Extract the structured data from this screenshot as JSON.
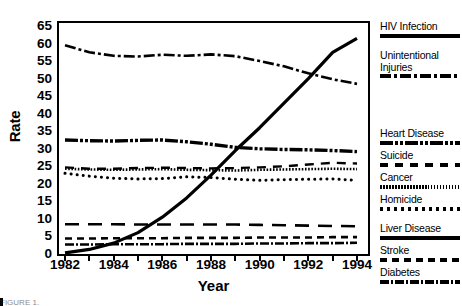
{
  "chart_data": {
    "type": "line",
    "title": "",
    "xlabel": "Year",
    "ylabel": "Rate",
    "xlim": [
      1982,
      1994
    ],
    "ylim": [
      0,
      65
    ],
    "ytick_step": 5,
    "grid": false,
    "legend_position": "right",
    "x": [
      1982,
      1983,
      1984,
      1985,
      1986,
      1987,
      1988,
      1989,
      1990,
      1991,
      1992,
      1993,
      1994
    ],
    "xtick_labels": [
      "1982",
      "1984",
      "1986",
      "1988",
      "1990",
      "1992",
      "1994"
    ],
    "ytick_labels": [
      "0",
      "5",
      "10",
      "15",
      "20",
      "25",
      "30",
      "35",
      "40",
      "45",
      "50",
      "55",
      "60",
      "65"
    ],
    "series": [
      {
        "name": "HIV Infection",
        "style": "solid",
        "values": [
          0.3,
          1.3,
          3.1,
          6.1,
          10.5,
          16.0,
          22.5,
          29.5,
          36.0,
          43.0,
          50.0,
          57.5,
          61.5
        ]
      },
      {
        "name": "Unintentional Injuries",
        "style": "dash-dot",
        "values": [
          59.5,
          57.5,
          56.5,
          56.3,
          56.8,
          56.5,
          56.9,
          56.4,
          55.0,
          53.5,
          51.5,
          49.8,
          48.5
        ]
      },
      {
        "name": "Heart Disease",
        "style": "heavy-dash-dot-dot",
        "values": [
          32.5,
          32.3,
          32.2,
          32.4,
          32.5,
          32.0,
          31.3,
          30.4,
          30.0,
          29.8,
          29.7,
          29.5,
          29.2
        ]
      },
      {
        "name": "Suicide",
        "style": "long-dash",
        "values": [
          24.7,
          24.3,
          24.3,
          24.5,
          24.6,
          24.5,
          24.4,
          24.5,
          24.7,
          25.0,
          25.5,
          26.0,
          25.8
        ]
      },
      {
        "name": "Cancer",
        "style": "fine-dotted",
        "values": [
          24.3,
          24.1,
          24.0,
          24.1,
          24.2,
          24.0,
          23.9,
          23.8,
          24.0,
          24.1,
          24.2,
          24.3,
          24.2
        ]
      },
      {
        "name": "Homicide",
        "style": "round-dotted",
        "values": [
          23.0,
          22.2,
          21.6,
          21.4,
          21.5,
          22.0,
          21.8,
          21.3,
          21.0,
          21.2,
          21.3,
          21.4,
          21.0
        ]
      },
      {
        "name": "Liver Disease",
        "style": "medium-dash",
        "values": [
          8.5,
          8.5,
          8.5,
          8.4,
          8.4,
          8.4,
          8.4,
          8.4,
          8.3,
          8.2,
          8.1,
          8.0,
          7.9
        ]
      },
      {
        "name": "Stroke",
        "style": "dashed",
        "values": [
          4.4,
          4.4,
          4.5,
          4.5,
          4.5,
          4.6,
          4.6,
          4.6,
          4.7,
          4.7,
          4.7,
          4.8,
          4.8
        ]
      },
      {
        "name": "Diabetes",
        "style": "dash-dot-short",
        "values": [
          2.7,
          2.7,
          2.8,
          2.8,
          2.8,
          2.9,
          2.9,
          2.9,
          3.0,
          3.0,
          3.1,
          3.1,
          3.2
        ]
      }
    ]
  },
  "axes": {
    "ylabel": "Rate",
    "xlabel": "Year"
  },
  "legend": {
    "entries": [
      {
        "label": "HIV Infection",
        "pattern": "p-solid",
        "top": 0,
        "swatch_top": 13
      },
      {
        "label": "Unintentional\nInjuries",
        "pattern": "p-dashdot",
        "top": 29,
        "swatch_top": 53
      },
      {
        "label": "Heart Disease",
        "pattern": "p-heart",
        "top": 107,
        "swatch_top": 120
      },
      {
        "label": "Suicide",
        "pattern": "p-dash",
        "top": 129,
        "swatch_top": 142
      },
      {
        "label": "Cancer",
        "pattern": "p-dot-fine",
        "top": 151,
        "swatch_top": 164
      },
      {
        "label": "Homicide",
        "pattern": "p-dot-round",
        "top": 173,
        "swatch_top": 186
      },
      {
        "label": "Liver Disease",
        "pattern": "p-solid",
        "top": 202,
        "swatch_top": 215
      },
      {
        "label": "Stroke",
        "pattern": "p-stroke",
        "top": 224,
        "swatch_top": 237
      },
      {
        "label": "Diabetes",
        "pattern": "p-diab",
        "top": 246,
        "swatch_top": 259
      }
    ]
  },
  "caption": {
    "text": "FIGURE 1."
  }
}
